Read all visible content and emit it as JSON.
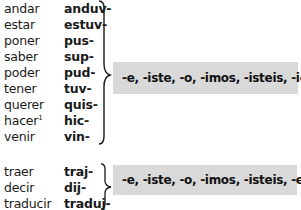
{
  "group1": {
    "rows": [
      {
        "infinitive": "andar",
        "stem": "anduv-"
      },
      {
        "infinitive": "estar",
        "stem": "estuv-"
      },
      {
        "infinitive": "poner",
        "stem": "pus-"
      },
      {
        "infinitive": "saber",
        "stem": "sup-"
      },
      {
        "infinitive": "poder",
        "stem": "pud-"
      },
      {
        "infinitive": "tener",
        "stem": "tuv-"
      },
      {
        "infinitive": "querer",
        "stem": "quis-"
      },
      {
        "infinitive": "hacer",
        "footnote": "1",
        "stem": "hic-"
      },
      {
        "infinitive": "venir",
        "stem": "vin-"
      }
    ],
    "endings": "-e, -iste, -o, -imos, -isteis, -ieron"
  },
  "group2": {
    "rows": [
      {
        "infinitive": "traer",
        "stem": "traj-"
      },
      {
        "infinitive": "decir",
        "stem": "dij-"
      },
      {
        "infinitive": "traducir",
        "stem": "traduj-"
      }
    ],
    "endings": "-e, -iste, -o, -imos, -isteis, -eron"
  },
  "colors": {
    "box_background": "#d9d9d9",
    "text": "#1a1a1a"
  }
}
